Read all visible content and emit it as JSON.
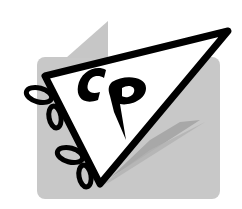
{
  "logo": {
    "monogram": "CP",
    "shape": "pennant-flag",
    "colors": {
      "background": "#ffffff",
      "panel": "#c8c8c8",
      "fold": "#c4c4c4",
      "shadow": "#a9a9a9",
      "pennant_fill": "#ffffff",
      "outline": "#000000"
    }
  }
}
